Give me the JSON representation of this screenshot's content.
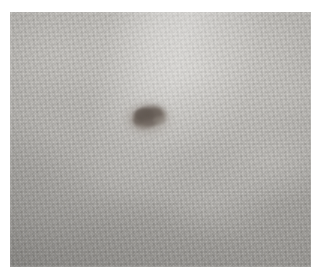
{
  "image": {
    "kind": "clinical-photograph",
    "subject": "skin-lesion",
    "description": "Close-up clinical photograph of human skin showing a single pigmented lesion",
    "alt_text": "Close-up photograph of pale mottled skin with a small irregular dark brown pigmented lesion near the centre",
    "canvas": {
      "width": 320,
      "height": 279,
      "background_color": "#ffffff"
    },
    "plate": {
      "x": 10,
      "y": 12,
      "width": 301,
      "height": 255,
      "border_color": "#ffffff"
    }
  },
  "skin": {
    "label": "skin-surface",
    "tone_name": "pale grey-tan",
    "base_color": "#b2b0ac",
    "highlight_color": "#cdcbc7",
    "shadow_color": "#9a9894",
    "texture": "fine mottled striations with micro-grain speckle",
    "illumination": "diffuse light from upper-right, vignetting toward lower-left"
  },
  "lesion": {
    "label": "pigmented-lesion",
    "clinical_name": "nevus",
    "center_x": 149,
    "center_y": 119,
    "width_px": 43,
    "height_px": 33,
    "shape": "irregular ovoid, long axis tilted",
    "core_color": "#6b625c",
    "mid_color": "#837a73",
    "halo_color": "#9b948d",
    "border": "soft, slightly blurred margin",
    "pigment_distribution": "darkest in the upper-left half, fading toward lower-right"
  },
  "annotations": {
    "has_text_overlay": false,
    "has_scale_bar": false,
    "has_watermark": false,
    "visible_labels": []
  }
}
